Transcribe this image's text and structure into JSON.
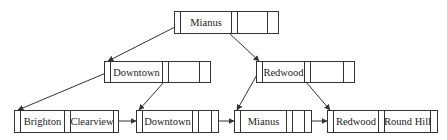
{
  "diagram": {
    "type": "B+ tree",
    "nodes": {
      "root": {
        "keys": [
          "Mianus",
          ""
        ]
      },
      "internal_left": {
        "keys": [
          "Downtown",
          ""
        ]
      },
      "internal_right": {
        "keys": [
          "Redwood",
          ""
        ]
      },
      "leaf_1": {
        "keys": [
          "Brighton",
          "Clearview"
        ]
      },
      "leaf_2": {
        "keys": [
          "Downtown",
          ""
        ]
      },
      "leaf_3": {
        "keys": [
          "Mianus",
          ""
        ]
      },
      "leaf_4": {
        "keys": [
          "Redwood",
          "Round Hill"
        ]
      }
    },
    "edges": [
      {
        "from": "root",
        "to": "internal_left"
      },
      {
        "from": "root",
        "to": "internal_right"
      },
      {
        "from": "internal_left",
        "to": "leaf_1"
      },
      {
        "from": "internal_left",
        "to": "leaf_2"
      },
      {
        "from": "internal_right",
        "to": "leaf_3"
      },
      {
        "from": "internal_right",
        "to": "leaf_4"
      },
      {
        "from": "leaf_1",
        "to": "leaf_2",
        "kind": "sibling"
      },
      {
        "from": "leaf_2",
        "to": "leaf_3",
        "kind": "sibling"
      },
      {
        "from": "leaf_3",
        "to": "leaf_4",
        "kind": "sibling"
      }
    ],
    "colors": {
      "line": "#333333",
      "background": "#ffffff"
    }
  }
}
